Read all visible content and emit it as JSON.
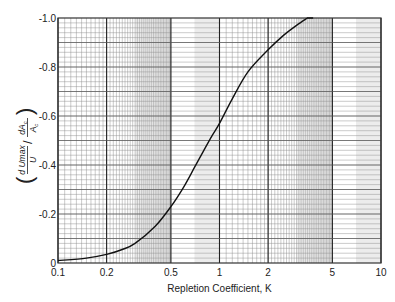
{
  "chart_data": {
    "type": "line",
    "title": "",
    "xlabel": "Repletion Coefficient, K",
    "ylabel": "(dUmax/U) / (dAc/Ac)",
    "ylabel_parts": {
      "num_top": "d Umax",
      "num_bottom": "U",
      "den_top": "dA",
      "den_sub": "c",
      "den_bottom": "A",
      "den_bottom_sub": "c"
    },
    "xscale": "log",
    "xlim": [
      0.1,
      10
    ],
    "ylim": [
      0,
      -1.0
    ],
    "grid": true,
    "x_ticks": [
      {
        "value": 0.1,
        "label": "0.1"
      },
      {
        "value": 0.2,
        "label": "0.2"
      },
      {
        "value": 0.5,
        "label": "0.5"
      },
      {
        "value": 1,
        "label": "1"
      },
      {
        "value": 2,
        "label": "2"
      },
      {
        "value": 5,
        "label": "5"
      },
      {
        "value": 10,
        "label": "10"
      }
    ],
    "y_ticks": [
      {
        "value": 0,
        "label": "0"
      },
      {
        "value": -0.2,
        "label": "-0.2"
      },
      {
        "value": -0.4,
        "label": "-0.4"
      },
      {
        "value": -0.6,
        "label": "-0.6"
      },
      {
        "value": -0.8,
        "label": "-0.8"
      },
      {
        "value": -1.0,
        "label": "-1.0"
      }
    ],
    "series": [
      {
        "name": "curve",
        "x": [
          0.1,
          0.15,
          0.2,
          0.25,
          0.3,
          0.4,
          0.5,
          0.6,
          0.7,
          0.8,
          0.9,
          1.0,
          1.2,
          1.5,
          2.0,
          2.5,
          3.0,
          3.5
        ],
        "y": [
          -0.01,
          -0.02,
          -0.035,
          -0.055,
          -0.08,
          -0.15,
          -0.23,
          -0.31,
          -0.39,
          -0.46,
          -0.52,
          -0.57,
          -0.67,
          -0.78,
          -0.87,
          -0.93,
          -0.97,
          -1.0
        ]
      }
    ],
    "legend": null
  }
}
